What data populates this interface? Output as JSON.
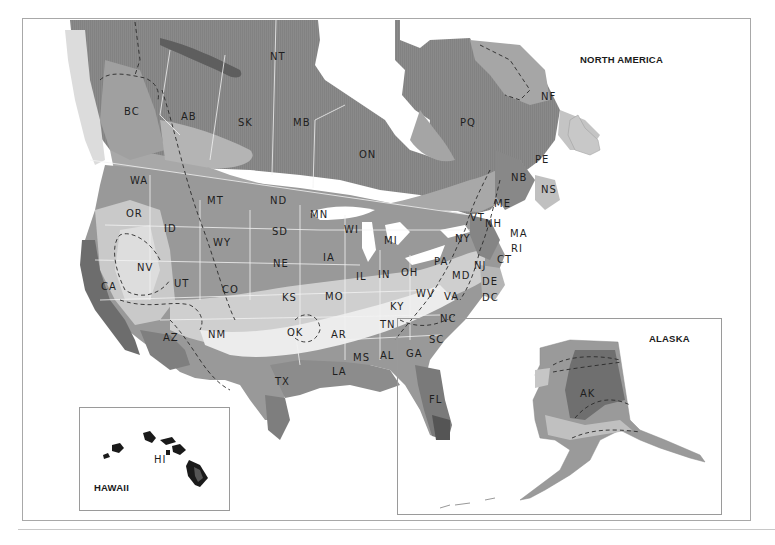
{
  "map": {
    "title": "NORTH AMERICA",
    "colors": {
      "zone_darkest": "#5a5a5a",
      "zone_dark": "#7c7c7c",
      "zone_mid_dark": "#8f8f8f",
      "zone_mid": "#a9a9a9",
      "zone_light": "#c6c6c6",
      "zone_lighter": "#dcdcdc",
      "zone_lightest": "#eeeeee",
      "water": "#ffffff",
      "border_line": "#f4f4f4",
      "dashed_line": "#2a2a2a"
    },
    "regions": {
      "NT": "NT",
      "BC": "BC",
      "AB": "AB",
      "SK": "SK",
      "MB": "MB",
      "ON": "ON",
      "PQ": "PQ",
      "NF": "NF",
      "PE": "PE",
      "NB": "NB",
      "NS": "NS",
      "WA": "WA",
      "OR": "OR",
      "ID": "ID",
      "MT": "MT",
      "WY": "WY",
      "NV": "NV",
      "CA": "CA",
      "UT": "UT",
      "CO": "CO",
      "AZ": "AZ",
      "NM": "NM",
      "ND": "ND",
      "SD": "SD",
      "NE": "NE",
      "KS": "KS",
      "OK": "OK",
      "TX": "TX",
      "MN": "MN",
      "IA": "IA",
      "MO": "MO",
      "AR": "AR",
      "LA": "LA",
      "WI": "WI",
      "IL": "IL",
      "MI": "MI",
      "IN": "IN",
      "OH": "OH",
      "KY": "KY",
      "TN": "TN",
      "MS": "MS",
      "AL": "AL",
      "GA": "GA",
      "FL": "FL",
      "SC": "SC",
      "NC": "NC",
      "VA": "VA",
      "WV": "WV",
      "PA": "PA",
      "NY": "NY",
      "VT": "VT",
      "NH": "NH",
      "ME": "ME",
      "MA": "MA",
      "RI": "RI",
      "CT": "CT",
      "NJ": "NJ",
      "DE": "DE",
      "MD": "MD",
      "DC": "DC"
    },
    "insets": {
      "hawaii": {
        "title": "HAWAII",
        "label": "HI"
      },
      "alaska": {
        "title": "ALASKA",
        "label": "AK"
      }
    }
  }
}
